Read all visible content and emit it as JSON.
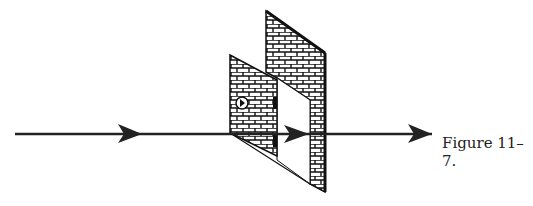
{
  "figure": {
    "caption": "Figure 11–7.",
    "elements": [
      "incoming-arrow",
      "brick-wall",
      "open-door",
      "outgoing-arrow"
    ],
    "colors": {
      "line": "#222222",
      "brick": "#111111",
      "background": "#ffffff"
    }
  }
}
